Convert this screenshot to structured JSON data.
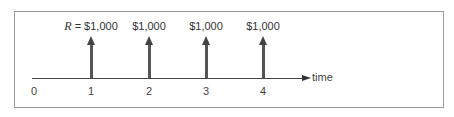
{
  "diagram": {
    "type": "cash-flow-timeline",
    "axis": {
      "label": "time",
      "ticks": [
        "0",
        "1",
        "2",
        "3",
        "4"
      ]
    },
    "flows": [
      {
        "period": "1",
        "variable": "R",
        "equals": " = ",
        "amount": "$1,000",
        "direction": "up"
      },
      {
        "period": "2",
        "variable": "",
        "equals": "",
        "amount": "$1,000",
        "direction": "up"
      },
      {
        "period": "3",
        "variable": "",
        "equals": "",
        "amount": "$1,000",
        "direction": "up"
      },
      {
        "period": "4",
        "variable": "",
        "equals": "",
        "amount": "$1,000",
        "direction": "up"
      }
    ],
    "colors": {
      "frame": "#9a9a9a",
      "axis": "#444444",
      "arrow": "#555555",
      "text": "#333333"
    }
  }
}
